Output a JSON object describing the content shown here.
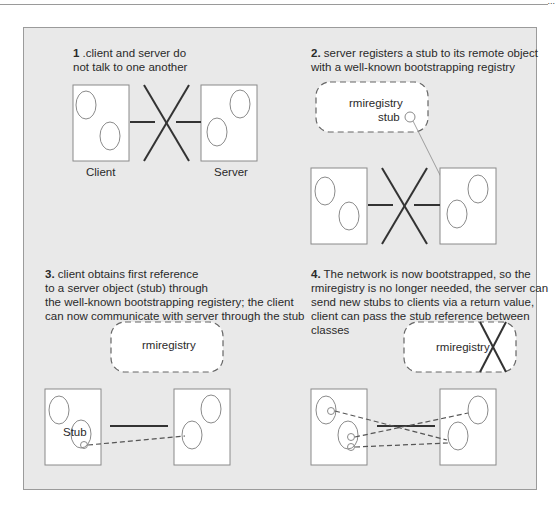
{
  "page": {
    "number": "..."
  },
  "colors": {
    "panel_bg": "#e9e9e9",
    "frame_border": "#9b9b9b",
    "box_fill": "#ffffff",
    "box_border": "#8a8a8a",
    "line": "#333333"
  },
  "panels": [
    {
      "step": "1",
      "caption_line1": " .client and server do",
      "caption_line2": "not talk to one another",
      "client_label": "Client",
      "server_label": "Server"
    },
    {
      "step": "2.",
      "caption_line1": " server registers a stub to its remote object",
      "caption_line2": "with a well-known bootstrapping registry",
      "registry_label": "rmiregistry",
      "stub_label": "stub"
    },
    {
      "step": "3.",
      "caption_line1": " client obtains first reference",
      "caption_line2": "to a server object (stub) through",
      "caption_line3": "the well-known bootstrapping registery; the client",
      "caption_line4": "can now communicate with server through the stub",
      "registry_label": "rmiregistry",
      "stub_label": "Stub"
    },
    {
      "step": "4.",
      "caption_line1": " The network is now bootstrapped, so the",
      "caption_line2": "rmiregistry is no longer needed, the server can",
      "caption_line3": "send new stubs to clients via a return value,",
      "caption_line4": "client can pass the stub reference between",
      "caption_line5": "classes",
      "registry_label": "rmiregistry"
    }
  ]
}
